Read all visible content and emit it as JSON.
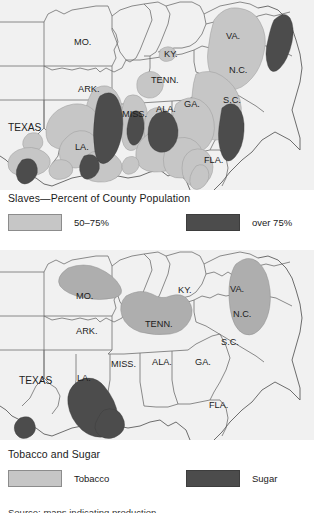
{
  "figure": {
    "panels": [
      {
        "id": "map-slaves",
        "title": "Slaves—Percent of County Population",
        "legend": [
          {
            "label": "50–75%",
            "swatch": "light",
            "color": "#c6c6c6"
          },
          {
            "label": "over 75%",
            "swatch": "dark",
            "color": "#4c4c4c"
          }
        ]
      },
      {
        "id": "map-crops",
        "title": "Tobacco and Sugar",
        "legend": [
          {
            "label": "Tobacco",
            "swatch": "light",
            "color": "#c6c6c6"
          },
          {
            "label": "Sugar",
            "swatch": "dark",
            "color": "#4c4c4c"
          }
        ]
      }
    ],
    "source_caption": "Source: maps indicating production"
  },
  "map_slaves": {
    "state_labels": [
      {
        "text": "MO.",
        "x": 74,
        "y": 45
      },
      {
        "text": "KY.",
        "x": 164,
        "y": 57
      },
      {
        "text": "VA.",
        "x": 226,
        "y": 39
      },
      {
        "text": "ARK.",
        "x": 78,
        "y": 92
      },
      {
        "text": "TENN.",
        "x": 151,
        "y": 83
      },
      {
        "text": "N.C.",
        "x": 229,
        "y": 73
      },
      {
        "text": "MISS.",
        "x": 122,
        "y": 117
      },
      {
        "text": "ALA.",
        "x": 156,
        "y": 112
      },
      {
        "text": "GA.",
        "x": 184,
        "y": 107
      },
      {
        "text": "S.C.",
        "x": 223,
        "y": 103
      },
      {
        "text": "TEXAS",
        "x": 8,
        "y": 131
      },
      {
        "text": "LA.",
        "x": 75,
        "y": 150
      },
      {
        "text": "FLA.",
        "x": 204,
        "y": 163
      }
    ]
  },
  "map_crops": {
    "state_labels": [
      {
        "text": "MO.",
        "x": 76,
        "y": 299
      },
      {
        "text": "KY.",
        "x": 178,
        "y": 293
      },
      {
        "text": "VA.",
        "x": 230,
        "y": 292
      },
      {
        "text": "ARK.",
        "x": 76,
        "y": 334
      },
      {
        "text": "TENN.",
        "x": 145,
        "y": 327
      },
      {
        "text": "N.C.",
        "x": 233,
        "y": 317
      },
      {
        "text": "S.C.",
        "x": 221,
        "y": 345
      },
      {
        "text": "MISS.",
        "x": 111,
        "y": 367
      },
      {
        "text": "ALA.",
        "x": 152,
        "y": 365
      },
      {
        "text": "GA.",
        "x": 195,
        "y": 365
      },
      {
        "text": "TEXAS",
        "x": 19,
        "y": 384
      },
      {
        "text": "LA.",
        "x": 77,
        "y": 381
      },
      {
        "text": "FLA.",
        "x": 209,
        "y": 408
      }
    ]
  }
}
